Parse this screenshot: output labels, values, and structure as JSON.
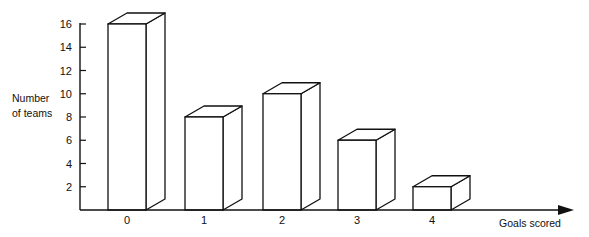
{
  "chart_data": {
    "type": "bar",
    "style": "3d-outline",
    "title": "",
    "xlabel": "Goals scored",
    "ylabel": "Number of teams",
    "ylabel_lines": [
      "Number",
      "of teams"
    ],
    "categories": [
      "0",
      "1",
      "2",
      "3",
      "4"
    ],
    "values": [
      16,
      8,
      10,
      6,
      2
    ],
    "yticks": [
      2,
      4,
      6,
      8,
      10,
      12,
      14,
      16
    ],
    "ylim": [
      0,
      16
    ],
    "grid": false,
    "legend": null,
    "colors": {
      "line": "#111111",
      "fill": "#ffffff"
    }
  }
}
